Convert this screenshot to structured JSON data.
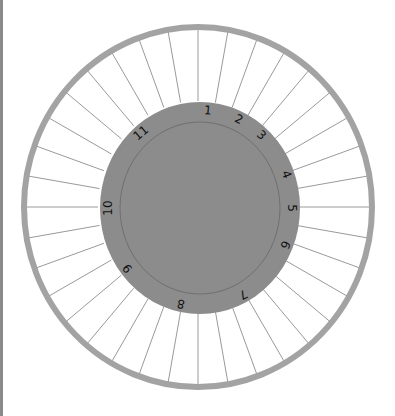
{
  "dial": {
    "center": {
      "x": 198,
      "y": 207
    },
    "outer_ring": {
      "rx": 174,
      "ry": 180,
      "stroke_width": 6,
      "color": "#a3a3a3"
    },
    "spokes": {
      "count": 36,
      "color": "#9a9a9a",
      "inner_r": 100,
      "outer_r": 176
    },
    "disc": {
      "rx": 100,
      "ry": 106,
      "color": "#8c8c8c"
    },
    "inner_circle": {
      "rx": 80,
      "ry": 86,
      "stroke": "#6f6f6f"
    },
    "labels": [
      {
        "text": "1",
        "angle": 5
      },
      {
        "text": "2",
        "angle": 25
      },
      {
        "text": "3",
        "angle": 42
      },
      {
        "text": "4",
        "angle": 70
      },
      {
        "text": "5",
        "angle": 90
      },
      {
        "text": "6",
        "angle": 112
      },
      {
        "text": "7",
        "angle": 152
      },
      {
        "text": "8",
        "angle": 192
      },
      {
        "text": "9",
        "angle": 232
      },
      {
        "text": "10",
        "angle": 270
      },
      {
        "text": "11",
        "angle": 320
      }
    ],
    "label_radius": 92
  },
  "left_bar": {
    "color": "#8a8a8a"
  }
}
